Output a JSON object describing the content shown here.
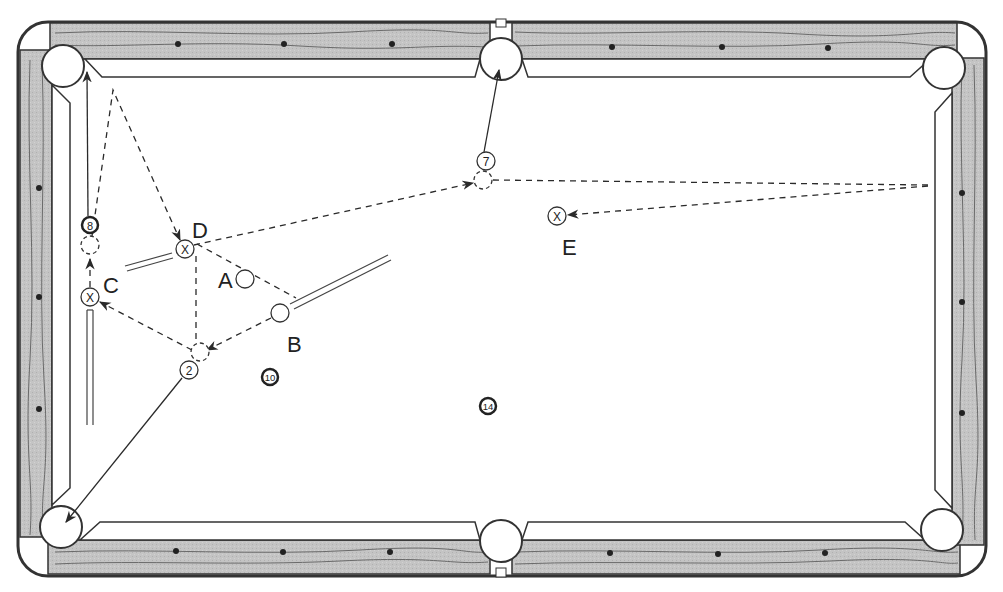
{
  "diagram": {
    "type": "billiards-shot-diagram",
    "table": {
      "rail_color": "#c8c8c8",
      "felt_color": "#ffffff",
      "line_color": "#3a3a3a",
      "pockets": [
        {
          "id": "top-left",
          "cx": 63,
          "cy": 66
        },
        {
          "id": "top-middle",
          "cx": 501,
          "cy": 59
        },
        {
          "id": "top-right",
          "cx": 944,
          "cy": 68
        },
        {
          "id": "bottom-left",
          "cx": 61,
          "cy": 527
        },
        {
          "id": "bottom-middle",
          "cx": 501,
          "cy": 541
        },
        {
          "id": "bottom-right",
          "cx": 942,
          "cy": 530
        }
      ]
    },
    "balls": [
      {
        "id": "ball-8",
        "label": "8",
        "cx": 90,
        "cy": 225,
        "r": 8,
        "style": "numbered-dark"
      },
      {
        "id": "ball-7",
        "label": "7",
        "cx": 486,
        "cy": 161,
        "r": 9,
        "style": "numbered"
      },
      {
        "id": "ball-2",
        "label": "2",
        "cx": 189,
        "cy": 370,
        "r": 9,
        "style": "numbered"
      },
      {
        "id": "ball-10",
        "label": "10",
        "cx": 270,
        "cy": 377,
        "r": 9,
        "style": "numbered-dark"
      },
      {
        "id": "ball-14",
        "label": "14",
        "cx": 488,
        "cy": 406,
        "r": 9,
        "style": "numbered-dark"
      },
      {
        "id": "ball-A",
        "label": "",
        "cx": 245,
        "cy": 279,
        "r": 9,
        "style": "plain"
      },
      {
        "id": "ball-B",
        "label": "",
        "cx": 280,
        "cy": 313,
        "r": 9,
        "style": "plain"
      }
    ],
    "ghost_balls": [
      {
        "id": "ghost-8",
        "cx": 90,
        "cy": 245,
        "r": 9
      },
      {
        "id": "ghost-7",
        "cx": 483,
        "cy": 180,
        "r": 9
      },
      {
        "id": "ghost-2",
        "cx": 200,
        "cy": 352,
        "r": 9
      }
    ],
    "target_spots": [
      {
        "id": "spot-C",
        "cx": 90,
        "cy": 297,
        "r": 9
      },
      {
        "id": "spot-D",
        "cx": 185,
        "cy": 249,
        "r": 9
      },
      {
        "id": "spot-E",
        "cx": 557,
        "cy": 216,
        "r": 9
      }
    ],
    "labels": [
      {
        "id": "label-A",
        "text": "A",
        "x": 228,
        "y": 288
      },
      {
        "id": "label-B",
        "text": "B",
        "x": 297,
        "y": 350
      },
      {
        "id": "label-C",
        "text": "C",
        "x": 113,
        "y": 292
      },
      {
        "id": "label-D",
        "text": "D",
        "x": 201,
        "y": 237
      },
      {
        "id": "label-E",
        "text": "E",
        "x": 570,
        "y": 255
      }
    ],
    "spot_mark": "X"
  }
}
